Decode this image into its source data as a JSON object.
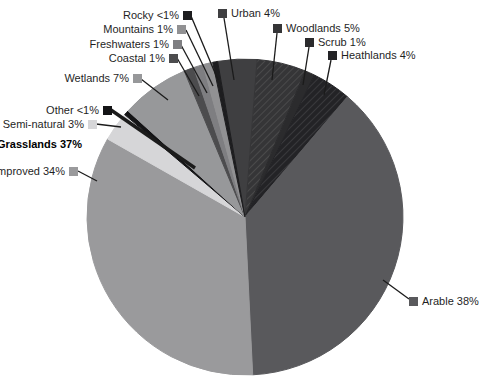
{
  "chart_data": {
    "type": "pie",
    "title": "",
    "unit": "%",
    "direction": "clockwise",
    "start_angle_deg": -10,
    "legend_position": "callouts-around-pie",
    "slices": [
      {
        "name": "Urban",
        "display": "Urban 4%",
        "value": 4,
        "pct_text": "4%",
        "color": "#3f3f41",
        "hatch": false,
        "label_side": "right"
      },
      {
        "name": "Woodlands",
        "display": "Woodlands 5%",
        "value": 5,
        "pct_text": "5%",
        "color": "#353537",
        "hatch": true,
        "label_side": "right"
      },
      {
        "name": "Scrub",
        "display": "Scrub 1%",
        "value": 1,
        "pct_text": "1%",
        "color": "#2b2b2d",
        "hatch": false,
        "label_side": "right"
      },
      {
        "name": "Heathlands",
        "display": "Heathlands 4%",
        "value": 4,
        "pct_text": "4%",
        "color": "#232326",
        "hatch": true,
        "label_side": "right"
      },
      {
        "name": "Arable",
        "display": "Arable 38%",
        "value": 38,
        "pct_text": "38%",
        "color": "#59595c",
        "hatch": false,
        "label_side": "right"
      },
      {
        "name": "Improved",
        "display": "Improved 34%",
        "value": 34,
        "pct_text": "34%",
        "color": "#9a9a9c",
        "hatch": false,
        "label_side": "left"
      },
      {
        "name": "Semi-natural",
        "display": "Semi-natural 3%",
        "value": 3,
        "pct_text": "3%",
        "color": "#d6d6d8",
        "hatch": false,
        "label_side": "left"
      },
      {
        "name": "Other",
        "display": "Other <1%",
        "value": 0.5,
        "pct_text": "<1%",
        "color": "#141416",
        "hatch": false,
        "label_side": "left"
      },
      {
        "name": "Wetlands",
        "display": "Wetlands 7%",
        "value": 7,
        "pct_text": "7%",
        "color": "#97989a",
        "hatch": false,
        "label_side": "left"
      },
      {
        "name": "Coastal",
        "display": "Coastal 1%",
        "value": 1,
        "pct_text": "1%",
        "color": "#4c4c4e",
        "hatch": false,
        "label_side": "left"
      },
      {
        "name": "Freshwaters",
        "display": "Freshwaters 1%",
        "value": 1,
        "pct_text": "1%",
        "color": "#7e7e81",
        "hatch": false,
        "label_side": "left"
      },
      {
        "name": "Mountains",
        "display": "Mountains 1%",
        "value": 1,
        "pct_text": "1%",
        "color": "#919193",
        "hatch": false,
        "label_side": "left"
      },
      {
        "name": "Rocky",
        "display": "Rocky <1%",
        "value": 0.5,
        "pct_text": "<1%",
        "color": "#1d1d1f",
        "hatch": false,
        "label_side": "left"
      }
    ],
    "group_annotation": {
      "display": "Grasslands 37%",
      "value": 37,
      "covers": [
        "Improved",
        "Semi-natural"
      ]
    },
    "leader_line_color": "#1b1b1b"
  }
}
